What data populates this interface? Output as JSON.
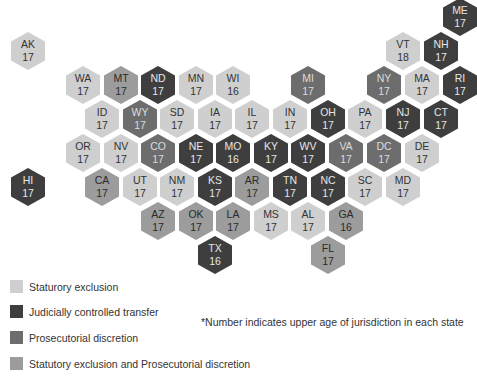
{
  "chart_data": {
    "type": "heatmap",
    "subtype": "hex-tile-map",
    "title": "",
    "note": "*Number indicates upper age of jurisdiction in each state",
    "categories": {
      "stat": "Statutory exclusion",
      "jud": "Judicially controlled transfer",
      "pros": "Prosecutorial discretion",
      "both": "Statutory exclusion and Prosecutorial discretion"
    },
    "colors": {
      "stat": "#cfcfcf",
      "jud": "#3e3e3e",
      "pros": "#6d6d6d",
      "both": "#9c9c9c"
    },
    "states": [
      {
        "abbr": "ME",
        "age": 17,
        "cat": "jud",
        "x": 460,
        "y": 17
      },
      {
        "abbr": "VT",
        "age": 18,
        "cat": "stat",
        "x": 403,
        "y": 51
      },
      {
        "abbr": "NH",
        "age": 17,
        "cat": "jud",
        "x": 441,
        "y": 51
      },
      {
        "abbr": "AK",
        "age": 17,
        "cat": "stat",
        "x": 28,
        "y": 51
      },
      {
        "abbr": "WA",
        "age": 17,
        "cat": "stat",
        "x": 83,
        "y": 85
      },
      {
        "abbr": "MT",
        "age": 17,
        "cat": "both",
        "x": 121,
        "y": 85
      },
      {
        "abbr": "ND",
        "age": 17,
        "cat": "jud",
        "x": 158,
        "y": 85
      },
      {
        "abbr": "MN",
        "age": 17,
        "cat": "stat",
        "x": 196,
        "y": 85
      },
      {
        "abbr": "WI",
        "age": 16,
        "cat": "stat",
        "x": 233,
        "y": 85
      },
      {
        "abbr": "MI",
        "age": 17,
        "cat": "pros",
        "x": 308,
        "y": 85
      },
      {
        "abbr": "NY",
        "age": 17,
        "cat": "pros",
        "x": 384,
        "y": 85
      },
      {
        "abbr": "MA",
        "age": 17,
        "cat": "stat",
        "x": 422,
        "y": 85
      },
      {
        "abbr": "RI",
        "age": 17,
        "cat": "jud",
        "x": 460,
        "y": 85
      },
      {
        "abbr": "ID",
        "age": 17,
        "cat": "stat",
        "x": 102,
        "y": 119
      },
      {
        "abbr": "WY",
        "age": 17,
        "cat": "pros",
        "x": 140,
        "y": 119
      },
      {
        "abbr": "SD",
        "age": 17,
        "cat": "stat",
        "x": 177,
        "y": 119
      },
      {
        "abbr": "IA",
        "age": 17,
        "cat": "stat",
        "x": 215,
        "y": 119
      },
      {
        "abbr": "IL",
        "age": 17,
        "cat": "stat",
        "x": 252,
        "y": 119
      },
      {
        "abbr": "IN",
        "age": 17,
        "cat": "stat",
        "x": 290,
        "y": 119
      },
      {
        "abbr": "OH",
        "age": 17,
        "cat": "jud",
        "x": 328,
        "y": 119
      },
      {
        "abbr": "PA",
        "age": 17,
        "cat": "stat",
        "x": 365,
        "y": 119
      },
      {
        "abbr": "NJ",
        "age": 17,
        "cat": "jud",
        "x": 403,
        "y": 119
      },
      {
        "abbr": "CT",
        "age": 17,
        "cat": "jud",
        "x": 441,
        "y": 119
      },
      {
        "abbr": "OR",
        "age": 17,
        "cat": "stat",
        "x": 83,
        "y": 153
      },
      {
        "abbr": "NV",
        "age": 17,
        "cat": "stat",
        "x": 121,
        "y": 153
      },
      {
        "abbr": "CO",
        "age": 17,
        "cat": "pros",
        "x": 158,
        "y": 153
      },
      {
        "abbr": "NE",
        "age": 17,
        "cat": "jud",
        "x": 196,
        "y": 153
      },
      {
        "abbr": "MO",
        "age": 16,
        "cat": "jud",
        "x": 233,
        "y": 153
      },
      {
        "abbr": "KY",
        "age": 17,
        "cat": "jud",
        "x": 271,
        "y": 153
      },
      {
        "abbr": "WV",
        "age": 17,
        "cat": "jud",
        "x": 308,
        "y": 153
      },
      {
        "abbr": "VA",
        "age": 17,
        "cat": "pros",
        "x": 346,
        "y": 153
      },
      {
        "abbr": "DC",
        "age": 17,
        "cat": "pros",
        "x": 384,
        "y": 153
      },
      {
        "abbr": "DE",
        "age": 17,
        "cat": "stat",
        "x": 422,
        "y": 153
      },
      {
        "abbr": "HI",
        "age": 17,
        "cat": "jud",
        "x": 28,
        "y": 187
      },
      {
        "abbr": "CA",
        "age": 17,
        "cat": "both",
        "x": 102,
        "y": 187
      },
      {
        "abbr": "UT",
        "age": 17,
        "cat": "stat",
        "x": 140,
        "y": 187
      },
      {
        "abbr": "NM",
        "age": 17,
        "cat": "stat",
        "x": 177,
        "y": 187
      },
      {
        "abbr": "KS",
        "age": 17,
        "cat": "jud",
        "x": 215,
        "y": 187
      },
      {
        "abbr": "AR",
        "age": 17,
        "cat": "both",
        "x": 252,
        "y": 187
      },
      {
        "abbr": "TN",
        "age": 17,
        "cat": "jud",
        "x": 290,
        "y": 187
      },
      {
        "abbr": "NC",
        "age": 17,
        "cat": "jud",
        "x": 328,
        "y": 187
      },
      {
        "abbr": "SC",
        "age": 17,
        "cat": "stat",
        "x": 365,
        "y": 187
      },
      {
        "abbr": "MD",
        "age": 17,
        "cat": "stat",
        "x": 403,
        "y": 187
      },
      {
        "abbr": "AZ",
        "age": 17,
        "cat": "both",
        "x": 158,
        "y": 221
      },
      {
        "abbr": "OK",
        "age": 17,
        "cat": "both",
        "x": 196,
        "y": 221
      },
      {
        "abbr": "LA",
        "age": 17,
        "cat": "both",
        "x": 233,
        "y": 221
      },
      {
        "abbr": "MS",
        "age": 17,
        "cat": "stat",
        "x": 271,
        "y": 221
      },
      {
        "abbr": "AL",
        "age": 17,
        "cat": "stat",
        "x": 308,
        "y": 221
      },
      {
        "abbr": "GA",
        "age": 16,
        "cat": "both",
        "x": 346,
        "y": 221
      },
      {
        "abbr": "TX",
        "age": 16,
        "cat": "jud",
        "x": 215,
        "y": 255
      },
      {
        "abbr": "FL",
        "age": 17,
        "cat": "both",
        "x": 328,
        "y": 255
      }
    ],
    "legend": [
      {
        "key": "stat",
        "label": "Staturory exclusion"
      },
      {
        "key": "jud",
        "label": "Judicially controlled transfer"
      },
      {
        "key": "pros",
        "label": "Prosecutorial discretion"
      },
      {
        "key": "both",
        "label": "Statutory exclusion and Prosecutorial discretion"
      }
    ],
    "legend_position": "bottom-left"
  },
  "legend": {
    "items": [
      {
        "label": "Staturory exclusion"
      },
      {
        "label": "Judicially controlled transfer"
      },
      {
        "label": "Prosecutorial discretion"
      },
      {
        "label": "Statutory exclusion and Prosecutorial discretion"
      }
    ]
  },
  "note": "*Number indicates upper age of jurisdiction in each state"
}
